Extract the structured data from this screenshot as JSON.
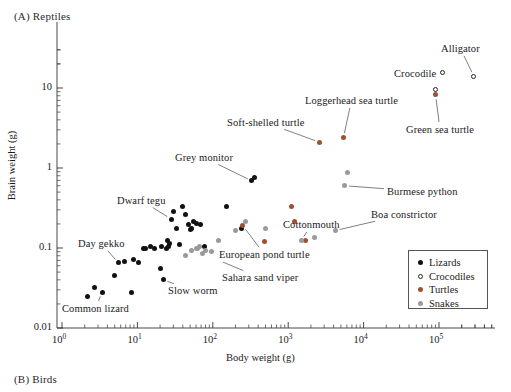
{
  "figure": {
    "panel_a_label": "(A)  Reptiles",
    "panel_b_label": "(B)  Birds"
  },
  "chart_data": {
    "type": "scatter",
    "title": "(A)  Reptiles",
    "xlabel": "Body weight (g)",
    "ylabel": "Brain weight (g)",
    "xscale": "log",
    "yscale": "log",
    "xlim": [
      1,
      600000
    ],
    "ylim": [
      0.01,
      30
    ],
    "grid": false,
    "legend_position": "bottom-right",
    "x_tick_labels": [
      "10",
      "10",
      "10",
      "10",
      "10",
      "10"
    ],
    "x_tick_exponents": [
      "0",
      "1",
      "2",
      "3",
      "4",
      "5"
    ],
    "x_tick_values": [
      1,
      10,
      100,
      1000,
      10000,
      100000
    ],
    "y_tick_labels": [
      "0.01",
      "0.1",
      "1",
      "10"
    ],
    "y_tick_values": [
      0.01,
      0.1,
      1,
      10
    ],
    "series": [
      {
        "name": "Lizards",
        "marker": "filled-circle",
        "color": "#111111",
        "points": [
          [
            2.2,
            0.025
          ],
          [
            2.7,
            0.032
          ],
          [
            3.4,
            0.028
          ],
          [
            5.0,
            0.045
          ],
          [
            5.6,
            0.065
          ],
          [
            6.8,
            0.068
          ],
          [
            8.4,
            0.028
          ],
          [
            9.0,
            0.072
          ],
          [
            10.5,
            0.066
          ],
          [
            12.0,
            0.098
          ],
          [
            13.0,
            0.098
          ],
          [
            15.0,
            0.105
          ],
          [
            17.0,
            0.1
          ],
          [
            20.0,
            0.055
          ],
          [
            21.0,
            0.105
          ],
          [
            22.0,
            0.04
          ],
          [
            24.0,
            0.098
          ],
          [
            25.0,
            0.125
          ],
          [
            26.0,
            0.105
          ],
          [
            27.0,
            0.115
          ],
          [
            28.0,
            0.23
          ],
          [
            30.0,
            0.29
          ],
          [
            33.0,
            0.175
          ],
          [
            36.0,
            0.11
          ],
          [
            40.0,
            0.33
          ],
          [
            44.0,
            0.26
          ],
          [
            48.0,
            0.195
          ],
          [
            50.0,
            0.17
          ],
          [
            52.0,
            0.175
          ],
          [
            55.0,
            0.215
          ],
          [
            60.0,
            0.2
          ],
          [
            68.0,
            0.195
          ],
          [
            78.0,
            0.105
          ],
          [
            150.0,
            0.33
          ],
          [
            240.0,
            0.175
          ],
          [
            330.0,
            0.69
          ],
          [
            360.0,
            0.76
          ]
        ]
      },
      {
        "name": "Crocodiles",
        "marker": "open-circle",
        "color": "#222222",
        "points": [
          [
            110000.0,
            15.5
          ],
          [
            290000.0,
            14.0
          ],
          [
            90000.0,
            9.5
          ]
        ]
      },
      {
        "name": "Turtles",
        "marker": "filled-circle",
        "color": "#9e5030",
        "points": [
          [
            250.0,
            0.19
          ],
          [
            480.0,
            0.12
          ],
          [
            1100.0,
            0.33
          ],
          [
            1200.0,
            0.215
          ],
          [
            1700.0,
            0.125
          ],
          [
            2600.0,
            2.1
          ],
          [
            5400.0,
            2.4
          ],
          [
            90000.0,
            8.2
          ]
        ]
      },
      {
        "name": "Snakes",
        "marker": "filled-circle",
        "color": "#9a9a9a",
        "points": [
          [
            44.0,
            0.08
          ],
          [
            52.0,
            0.092
          ],
          [
            60.0,
            0.098
          ],
          [
            63.0,
            0.098
          ],
          [
            66.0,
            0.103
          ],
          [
            72.0,
            0.085
          ],
          [
            80.0,
            0.092
          ],
          [
            95.0,
            0.09
          ],
          [
            120.0,
            0.125
          ],
          [
            200.0,
            0.165
          ],
          [
            270.0,
            0.215
          ],
          [
            500.0,
            0.175
          ],
          [
            1500.0,
            0.125
          ],
          [
            2200.0,
            0.135
          ],
          [
            4200.0,
            0.165
          ],
          [
            5600.0,
            0.6
          ],
          [
            6200.0,
            0.87
          ]
        ]
      }
    ],
    "annotations": [
      {
        "label": "Common lizard",
        "target": [
          3.4,
          0.028
        ]
      },
      {
        "label": "Day gekko",
        "target": [
          5.6,
          0.065
        ]
      },
      {
        "label": "Dwarf tegu",
        "target": [
          28.0,
          0.23
        ]
      },
      {
        "label": "Slow worm",
        "target": [
          22.0,
          0.04
        ]
      },
      {
        "label": "Grey monitor",
        "target": [
          330.0,
          0.69
        ]
      },
      {
        "label": "Sahara sand viper",
        "target": [
          120.0,
          0.07
        ]
      },
      {
        "label": "European pond turtle",
        "target": [
          250.0,
          0.19
        ]
      },
      {
        "label": "Cottonmouth",
        "target": [
          1500.0,
          0.125
        ]
      },
      {
        "label": "Soft-shelled turtle",
        "target": [
          2600.0,
          2.1
        ]
      },
      {
        "label": "Loggerhead sea turtle",
        "target": [
          5400.0,
          2.4
        ]
      },
      {
        "label": "Boa constrictor",
        "target": [
          4200.0,
          0.165
        ]
      },
      {
        "label": "Burmese python",
        "target": [
          5600.0,
          0.6
        ]
      },
      {
        "label": "Green sea turtle",
        "target": [
          90000.0,
          8.2
        ]
      },
      {
        "label": "Crocodile",
        "target": [
          110000.0,
          15.5
        ]
      },
      {
        "label": "Alligator",
        "target": [
          290000.0,
          14.0
        ]
      }
    ],
    "legend_entries": [
      {
        "label": "Lizards",
        "marker": "filled-circle",
        "color": "#111111"
      },
      {
        "label": "Crocodiles",
        "marker": "open-circle",
        "color": "#222222"
      },
      {
        "label": "Turtles",
        "marker": "filled-circle",
        "color": "#9e5030"
      },
      {
        "label": "Snakes",
        "marker": "filled-circle",
        "color": "#9a9a9a"
      }
    ]
  }
}
